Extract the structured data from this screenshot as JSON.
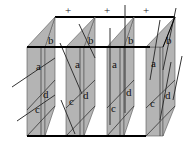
{
  "diagram": {
    "colors": {
      "panel_fill": "#b4b4b4",
      "frame": "#000000",
      "line": "#333333",
      "background": "#ffffff"
    },
    "top_markers": [
      "+",
      "+",
      "+"
    ],
    "panels": [
      {
        "id": "panel-1",
        "labels": {
          "b": "b",
          "a": "a",
          "d": "d",
          "c": "c"
        }
      },
      {
        "id": "panel-2",
        "labels": {
          "b": "b",
          "a": "a",
          "d": "d",
          "c": "c"
        }
      },
      {
        "id": "panel-3",
        "labels": {
          "b": "b",
          "a": "a",
          "d": "d",
          "c": "c"
        }
      },
      {
        "id": "panel-4",
        "labels": {
          "b": "b",
          "a": "a",
          "d": "d",
          "c": "c"
        }
      }
    ]
  }
}
